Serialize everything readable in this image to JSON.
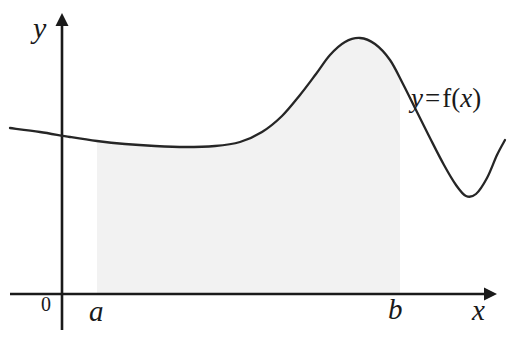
{
  "figure": {
    "background_color": "#ffffff",
    "curve_color": "#262626",
    "axis_color": "#1a1a1a",
    "shade_color": "#f2f2f2"
  },
  "labels": {
    "y_axis": "y",
    "x_axis": "x",
    "origin": "0",
    "lower_limit": "a",
    "upper_limit": "b",
    "curve_lhs": "y",
    "curve_eq": "=",
    "curve_f": "f(",
    "curve_var": "x",
    "curve_close": ")"
  },
  "chart_data": {
    "type": "line",
    "xlabel": "x",
    "ylabel": "y",
    "grid": false,
    "legend": null,
    "annotations": [
      {
        "text": "y = f(x)",
        "x": 411,
        "y": 98
      },
      {
        "text": "a",
        "x": 97,
        "y": 310
      },
      {
        "text": "b",
        "x": 396,
        "y": 310
      },
      {
        "text": "0",
        "x": 48,
        "y": 304
      }
    ],
    "axes": {
      "origin_px": [
        62,
        294
      ],
      "x_axis_px": {
        "x1": 10,
        "x2": 490,
        "y": 294,
        "arrow": "right"
      },
      "y_axis_px": {
        "x": 62,
        "y1": 18,
        "y2": 330,
        "arrow": "up"
      }
    },
    "shaded_region": {
      "label": "area under f from a to b",
      "x_start_px": 97,
      "x_end_px": 400,
      "fill": "#f2f2f2"
    },
    "series": [
      {
        "name": "y = f(x)",
        "points_px": [
          [
            10,
            128
          ],
          [
            40,
            132
          ],
          [
            70,
            137
          ],
          [
            97,
            141
          ],
          [
            125,
            144
          ],
          [
            155,
            146
          ],
          [
            185,
            147
          ],
          [
            215,
            146
          ],
          [
            240,
            142
          ],
          [
            262,
            132
          ],
          [
            282,
            116
          ],
          [
            300,
            95
          ],
          [
            316,
            74
          ],
          [
            330,
            55
          ],
          [
            345,
            42
          ],
          [
            360,
            38
          ],
          [
            375,
            44
          ],
          [
            390,
            60
          ],
          [
            403,
            84
          ],
          [
            416,
            110
          ],
          [
            430,
            138
          ],
          [
            444,
            165
          ],
          [
            456,
            185
          ],
          [
            466,
            196
          ],
          [
            476,
            194
          ],
          [
            487,
            178
          ],
          [
            497,
            155
          ],
          [
            505,
            140
          ]
        ]
      }
    ]
  }
}
